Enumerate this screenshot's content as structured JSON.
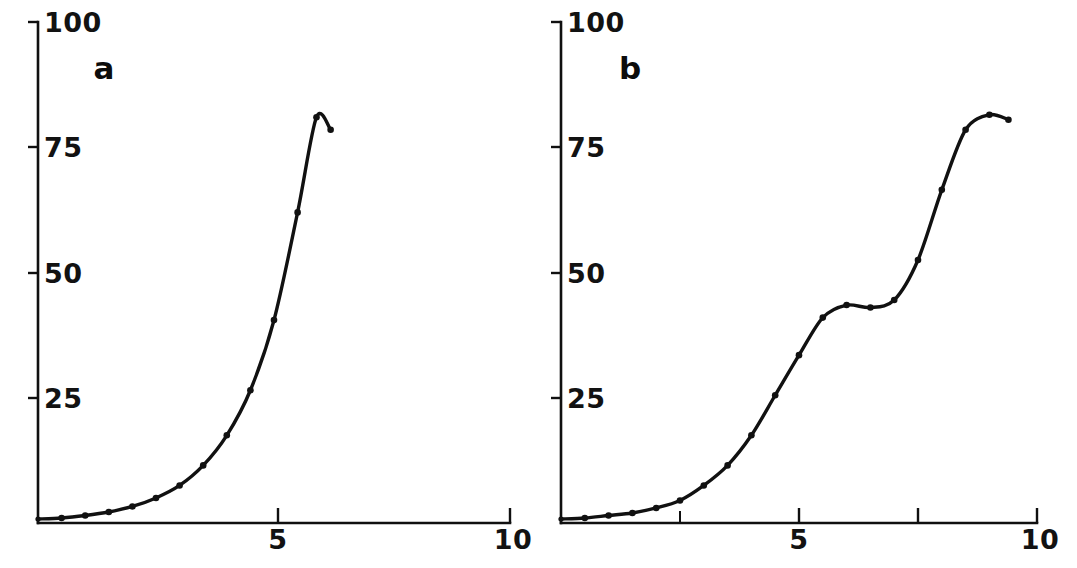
{
  "figure": {
    "background": "#ffffff",
    "ink_color": "#111111",
    "width": 1077,
    "height": 568
  },
  "chart_data": [
    {
      "type": "line",
      "panel_label": "a",
      "title": "",
      "xlabel": "",
      "ylabel": "",
      "xlim": [
        0,
        10
      ],
      "ylim": [
        0,
        100
      ],
      "xticks": [
        5,
        10
      ],
      "xtick_labels": [
        "5",
        "10"
      ],
      "yticks": [
        25,
        50,
        75,
        100
      ],
      "ytick_labels": [
        "25",
        "50",
        "75",
        "100"
      ],
      "x_minor_ticks": [],
      "grid": false,
      "legend": "none",
      "markers": "filled-circle",
      "x": [
        0.0,
        0.5,
        1.0,
        1.5,
        2.0,
        2.5,
        3.0,
        3.5,
        4.0,
        4.5,
        5.0,
        5.5,
        5.9,
        6.2
      ],
      "y": [
        0.8,
        1.0,
        1.5,
        2.2,
        3.3,
        5.0,
        7.5,
        11.5,
        17.5,
        26.5,
        40.5,
        62.0,
        81.0,
        78.5
      ],
      "annotations": [
        "curve rises sigmoidally, plateaus near 81 then hooks slightly down at the final point"
      ]
    },
    {
      "type": "line",
      "panel_label": "b",
      "title": "",
      "xlabel": "",
      "ylabel": "",
      "xlim": [
        0,
        10
      ],
      "ylim": [
        0,
        100
      ],
      "xticks": [
        5,
        10
      ],
      "xtick_labels": [
        "5",
        "10"
      ],
      "yticks": [
        25,
        50,
        75,
        100
      ],
      "ytick_labels": [
        "25",
        "50",
        "75",
        "100"
      ],
      "x_minor_ticks": [
        2.5,
        7.5
      ],
      "grid": false,
      "legend": "none",
      "markers": "filled-circle",
      "x": [
        0.0,
        0.5,
        1.0,
        1.5,
        2.0,
        2.5,
        3.0,
        3.5,
        4.0,
        4.5,
        5.0,
        5.5,
        6.0,
        6.5,
        7.0,
        7.5,
        8.0,
        8.5,
        9.0,
        9.4
      ],
      "y": [
        0.8,
        1.0,
        1.5,
        2.0,
        3.0,
        4.5,
        7.5,
        11.5,
        17.5,
        25.5,
        33.5,
        41.0,
        43.5,
        43.0,
        44.5,
        52.5,
        66.5,
        78.5,
        81.5,
        80.5
      ],
      "annotations": [
        "diauxic double-sigmoid: first rise to a shoulder near 43, brief plateau, second rise to final plateau near 81"
      ]
    }
  ],
  "panels": {
    "a": {
      "label": "a"
    },
    "b": {
      "label": "b"
    }
  }
}
